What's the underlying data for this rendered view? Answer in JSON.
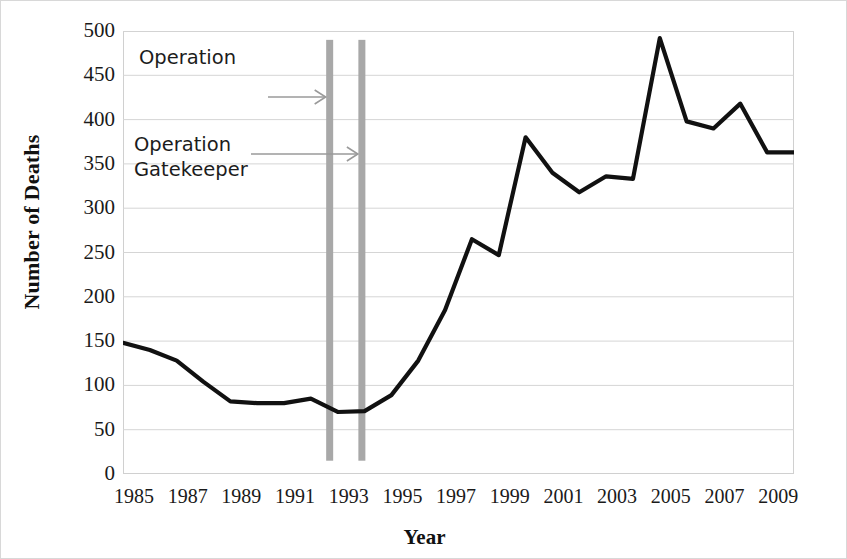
{
  "chart_data": {
    "type": "line",
    "title": "",
    "xlabel": "Year",
    "ylabel": "Number of Deaths",
    "xlim": [
      1985,
      2010
    ],
    "ylim": [
      0,
      500
    ],
    "ytick_labels": [
      "500",
      "450",
      "400",
      "350",
      "300",
      "250",
      "200",
      "150",
      "100",
      "50",
      "0"
    ],
    "ytick_values": [
      500,
      450,
      400,
      350,
      300,
      250,
      200,
      150,
      100,
      50,
      0
    ],
    "xtick_labels": [
      "1985",
      "1987",
      "1989",
      "1991",
      "1993",
      "1995",
      "1997",
      "1999",
      "2001",
      "2003",
      "2005",
      "2007",
      "2009"
    ],
    "xtick_values": [
      1985,
      1987,
      1989,
      1991,
      1993,
      1995,
      1997,
      1999,
      2001,
      2003,
      2005,
      2007,
      2009
    ],
    "grid": "horizontal",
    "legend": "none",
    "line_color": "#111111",
    "series": [
      {
        "name": "Number of Deaths",
        "x": [
          1985,
          1986,
          1987,
          1988,
          1989,
          1990,
          1991,
          1992,
          1993,
          1994,
          1995,
          1996,
          1997,
          1998,
          1999,
          2000,
          2001,
          2002,
          2003,
          2004,
          2005,
          2006,
          2007,
          2008,
          2009,
          2010
        ],
        "values": [
          148,
          140,
          128,
          104,
          82,
          80,
          80,
          85,
          70,
          71,
          89,
          128,
          185,
          265,
          247,
          380,
          340,
          318,
          336,
          333,
          492,
          398,
          390,
          418,
          363,
          363
        ]
      }
    ],
    "annotations": [
      {
        "name": "operation-marker-1",
        "text": "Operation",
        "arrow_target_year": 1992.7,
        "marker_color": "#a8a8a8"
      },
      {
        "name": "operation-gatekeeper-marker",
        "text": "Operation\nGatekeeper",
        "arrow_target_year": 1993.9,
        "marker_color": "#a8a8a8"
      }
    ],
    "markers": [
      {
        "label": "Operation",
        "year": 1992.7,
        "y_top": 490,
        "y_bottom": 15
      },
      {
        "label": "Operation Gatekeeper",
        "year": 1993.9,
        "y_top": 490,
        "y_bottom": 15
      }
    ]
  }
}
